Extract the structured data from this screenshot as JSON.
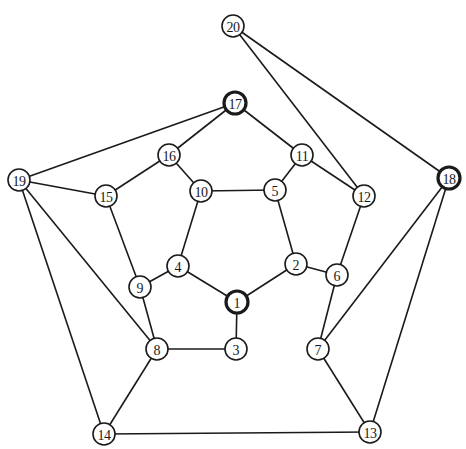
{
  "diagram": {
    "type": "graph",
    "node_radius": 11,
    "colors": {
      "stroke": "#1a1a1a",
      "fill": "#ffffff",
      "background": "#ffffff"
    },
    "nodes": [
      {
        "id": "1",
        "label": "1",
        "x": 237,
        "y": 302,
        "highlight": true
      },
      {
        "id": "2",
        "label": "2",
        "x": 296,
        "y": 264,
        "highlight": false
      },
      {
        "id": "3",
        "label": "3",
        "x": 236,
        "y": 349,
        "highlight": false
      },
      {
        "id": "4",
        "label": "4",
        "x": 178,
        "y": 266,
        "highlight": false
      },
      {
        "id": "5",
        "label": "5",
        "x": 275,
        "y": 190,
        "highlight": false
      },
      {
        "id": "6",
        "label": "6",
        "x": 337,
        "y": 275,
        "highlight": false
      },
      {
        "id": "7",
        "label": "7",
        "x": 318,
        "y": 349,
        "highlight": false
      },
      {
        "id": "8",
        "label": "8",
        "x": 157,
        "y": 349,
        "highlight": false
      },
      {
        "id": "9",
        "label": "9",
        "x": 140,
        "y": 287,
        "highlight": false
      },
      {
        "id": "10",
        "label": "10",
        "x": 201,
        "y": 191,
        "highlight": false
      },
      {
        "id": "11",
        "label": "11",
        "x": 302,
        "y": 155,
        "highlight": false
      },
      {
        "id": "12",
        "label": "12",
        "x": 364,
        "y": 196,
        "highlight": false
      },
      {
        "id": "13",
        "label": "13",
        "x": 370,
        "y": 432,
        "highlight": false
      },
      {
        "id": "14",
        "label": "14",
        "x": 104,
        "y": 434,
        "highlight": false
      },
      {
        "id": "15",
        "label": "15",
        "x": 106,
        "y": 196,
        "highlight": false
      },
      {
        "id": "16",
        "label": "16",
        "x": 169,
        "y": 155,
        "highlight": false
      },
      {
        "id": "17",
        "label": "17",
        "x": 235,
        "y": 103,
        "highlight": true
      },
      {
        "id": "18",
        "label": "18",
        "x": 449,
        "y": 178,
        "highlight": true
      },
      {
        "id": "19",
        "label": "19",
        "x": 19,
        "y": 180,
        "highlight": false
      },
      {
        "id": "20",
        "label": "20",
        "x": 233,
        "y": 26,
        "highlight": false
      }
    ],
    "edges": [
      [
        "20",
        "12"
      ],
      [
        "20",
        "18"
      ],
      [
        "17",
        "19"
      ],
      [
        "17",
        "16"
      ],
      [
        "17",
        "11"
      ],
      [
        "16",
        "15"
      ],
      [
        "16",
        "10"
      ],
      [
        "19",
        "15"
      ],
      [
        "19",
        "8"
      ],
      [
        "19",
        "14"
      ],
      [
        "15",
        "9"
      ],
      [
        "10",
        "5"
      ],
      [
        "10",
        "4"
      ],
      [
        "11",
        "5"
      ],
      [
        "11",
        "12"
      ],
      [
        "12",
        "6"
      ],
      [
        "18",
        "7"
      ],
      [
        "18",
        "13"
      ],
      [
        "5",
        "2"
      ],
      [
        "2",
        "6"
      ],
      [
        "2",
        "1"
      ],
      [
        "4",
        "9"
      ],
      [
        "4",
        "1"
      ],
      [
        "9",
        "8"
      ],
      [
        "1",
        "3"
      ],
      [
        "8",
        "3"
      ],
      [
        "8",
        "14"
      ],
      [
        "6",
        "7"
      ],
      [
        "7",
        "13"
      ],
      [
        "14",
        "13"
      ]
    ]
  }
}
